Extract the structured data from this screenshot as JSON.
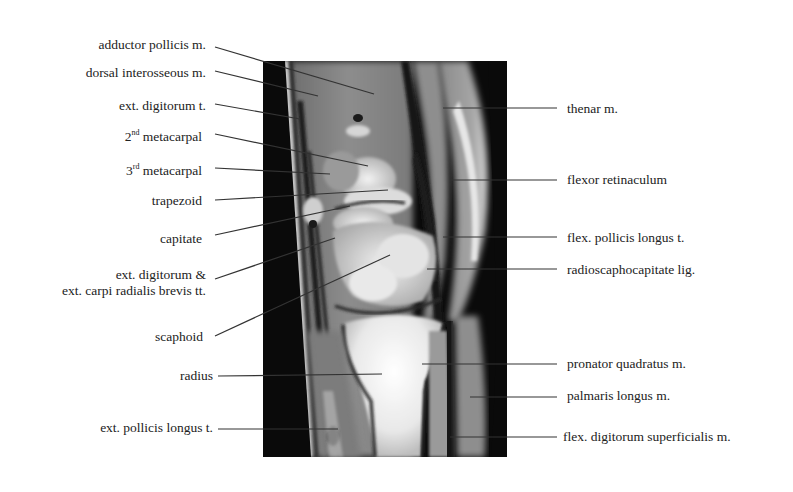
{
  "figure": {
    "type": "annotated sagittal MRI of wrist",
    "left_labels": [
      {
        "id": "adductor-pollicis",
        "text": "adductor pollicis m."
      },
      {
        "id": "dorsal-interosseous",
        "text": "dorsal interosseous m."
      },
      {
        "id": "ext-digitorum-t",
        "text": "ext. digitorum t."
      },
      {
        "id": "second-metacarpal",
        "ordinal": "2",
        "sup": "nd",
        "text": " metacarpal"
      },
      {
        "id": "third-metacarpal",
        "ordinal": "3",
        "sup": "rd",
        "text": " metacarpal"
      },
      {
        "id": "trapezoid",
        "text": "trapezoid"
      },
      {
        "id": "capitate",
        "text": "capitate"
      },
      {
        "id": "ext-digitorum-ecrb",
        "line1": "ext. digitorum &",
        "line2": "ext. carpi radialis brevis tt."
      },
      {
        "id": "scaphoid",
        "text": "scaphoid"
      },
      {
        "id": "radius",
        "text": "radius"
      },
      {
        "id": "ext-pollicis-longus",
        "text": "ext. pollicis longus t."
      }
    ],
    "right_labels": [
      {
        "id": "thenar",
        "text": "thenar m."
      },
      {
        "id": "flexor-retinaculum",
        "text": "flexor retinaculum"
      },
      {
        "id": "flex-pollicis-longus",
        "text": "flex. pollicis longus t."
      },
      {
        "id": "radioscaphocapitate",
        "text": "radioscaphocapitate  lig."
      },
      {
        "id": "pronator-quadratus",
        "text": "pronator quadratus  m."
      },
      {
        "id": "palmaris-longus",
        "text": "palmaris longus  m."
      },
      {
        "id": "flex-digitorum-superficialis",
        "text": "flex. digitorum superficialis  m."
      }
    ]
  },
  "colors": {
    "background": "#ffffff",
    "text": "#222222",
    "leader_line": "#333333",
    "mri_background": "#0a0a0a"
  }
}
